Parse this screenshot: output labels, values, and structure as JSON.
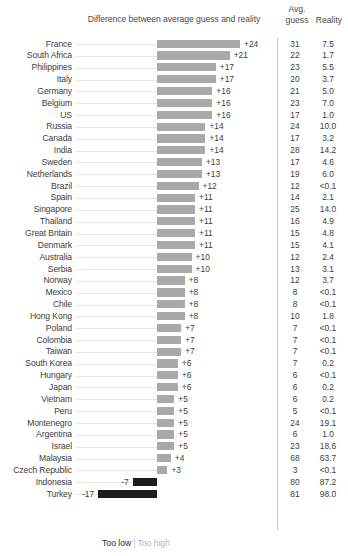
{
  "header": {
    "diff_title": "Difference between average guess and reality",
    "avg_line1": "Avg.",
    "avg_line2": "guess",
    "reality": "Reality"
  },
  "legend": {
    "too_low": "Too low",
    "separator": "|",
    "too_high": "Too high"
  },
  "colors": {
    "bar_positive": "#a9a9a9",
    "bar_negative": "#1c1c1c",
    "leader_line": "#e6e6e6",
    "divider": "#c9c9c9",
    "text": "#3d3d3d",
    "legend_high": "#b4b4b4"
  },
  "chart_data": {
    "type": "bar",
    "title": "Difference between average guess and reality",
    "xlabel": "",
    "ylabel": "",
    "orientation": "horizontal",
    "baseline": 0,
    "xlim": [
      -17,
      24
    ],
    "grid": false,
    "legend_position": "bottom",
    "legend_entries": [
      "Too low",
      "Too high"
    ],
    "columns": [
      "Country",
      "Difference",
      "Avg. guess",
      "Reality"
    ],
    "categories": [
      "France",
      "South Africa",
      "Philippines",
      "Italy",
      "Germany",
      "Belgium",
      "US",
      "Russia",
      "Canada",
      "India",
      "Sweden",
      "Netherlands",
      "Brazil",
      "Spain",
      "Singapore",
      "Thailand",
      "Great Britain",
      "Denmark",
      "Australia",
      "Serbia",
      "Norway",
      "Mexico",
      "Chile",
      "Hong Kong",
      "Poland",
      "Colombia",
      "Taiwan",
      "South Korea",
      "Hungary",
      "Japan",
      "Vietnam",
      "Peru",
      "Montenegro",
      "Argentina",
      "Israel",
      "Malaysia",
      "Czech Republic",
      "Indonesia",
      "Turkey"
    ],
    "values": [
      24,
      21,
      17,
      17,
      16,
      16,
      16,
      14,
      14,
      14,
      13,
      13,
      12,
      11,
      11,
      11,
      11,
      11,
      10,
      10,
      8,
      8,
      8,
      8,
      7,
      7,
      7,
      6,
      6,
      6,
      5,
      5,
      5,
      5,
      5,
      4,
      3,
      -7,
      -17
    ],
    "value_labels": [
      "+24",
      "+21",
      "+17",
      "+17",
      "+16",
      "+16",
      "+16",
      "+14",
      "+14",
      "+14",
      "+13",
      "+13",
      "+12",
      "+11",
      "+11",
      "+11",
      "+11",
      "+11",
      "+10",
      "+10",
      "+8",
      "+8",
      "+8",
      "+8",
      "+7",
      "+7",
      "+7",
      "+6",
      "+6",
      "+6",
      "+5",
      "+5",
      "+5",
      "+5",
      "+5",
      "+4",
      "+3",
      "-7",
      "-17"
    ],
    "avg_guess": [
      "31",
      "22",
      "23",
      "20",
      "21",
      "23",
      "17",
      "24",
      "17",
      "28",
      "17",
      "19",
      "12",
      "14",
      "25",
      "16",
      "15",
      "15",
      "12",
      "13",
      "12",
      "8",
      "8",
      "10",
      "7",
      "7",
      "7",
      "7",
      "6",
      "6",
      "6",
      "5",
      "24",
      "6",
      "23",
      "68",
      "3",
      "80",
      "81"
    ],
    "reality": [
      "7.5",
      "1.7",
      "5.5",
      "3.7",
      "5.0",
      "7.0",
      "1.0",
      "10.0",
      "3.2",
      "14.2",
      "4.6",
      "6.0",
      "<0.1",
      "2.1",
      "14.0",
      "4.9",
      "4.8",
      "4.1",
      "2.4",
      "3.1",
      "3.7",
      "<0.1",
      "<0.1",
      "1.8",
      "<0.1",
      "<0.1",
      "<0.1",
      "0.2",
      "<0.1",
      "0.2",
      "0.2",
      "<0.1",
      "19.1",
      "1.0",
      "18.6",
      "63.7",
      "<0.1",
      "87.2",
      "98.0"
    ]
  }
}
